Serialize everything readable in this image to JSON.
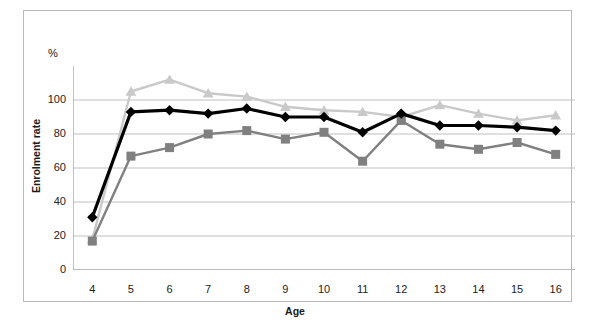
{
  "chart_data": {
    "type": "line",
    "title": "",
    "xlabel": "Age",
    "ylabel": "Enrolment rate",
    "yunit": "%",
    "x": [
      4,
      5,
      6,
      7,
      8,
      9,
      10,
      11,
      12,
      13,
      14,
      15,
      16
    ],
    "xtick_labels": [
      "4",
      "5",
      "6",
      "7",
      "8",
      "9",
      "10",
      "11",
      "12",
      "13",
      "14",
      "15",
      "16"
    ],
    "ytick_labels": [
      "0",
      "20",
      "40",
      "60",
      "80",
      "100"
    ],
    "ylim": [
      0,
      120
    ],
    "ytick_values": [
      0,
      20,
      40,
      60,
      80,
      100
    ],
    "grid": "horizontal",
    "legend_position": "top-center",
    "series": [
      {
        "name": "Indigenous",
        "color": "#808080",
        "marker": "square",
        "values": [
          17,
          67,
          72,
          80,
          82,
          77,
          81,
          64,
          88,
          74,
          71,
          75,
          68
        ]
      },
      {
        "name": "Non-Indigenous",
        "color": "#c9c9c9",
        "marker": "triangle",
        "values": [
          18,
          105,
          112,
          104,
          102,
          96,
          94,
          93,
          90,
          97,
          92,
          88,
          91
        ]
      },
      {
        "name": "Total Indigenous & non-Indigenous",
        "color": "#000000",
        "marker": "diamond",
        "values": [
          31,
          93,
          94,
          92,
          95,
          90,
          90,
          81,
          92,
          85,
          85,
          84,
          82
        ]
      }
    ]
  },
  "legend": {
    "items": [
      {
        "label": "Indigenous"
      },
      {
        "label": "Non-Indigenous"
      },
      {
        "label": "Total Indigenous & non-Indigenous"
      }
    ]
  },
  "axes": {
    "y_unit_symbol": "%",
    "y_title": "Enrolment rate",
    "x_title": "Age"
  }
}
